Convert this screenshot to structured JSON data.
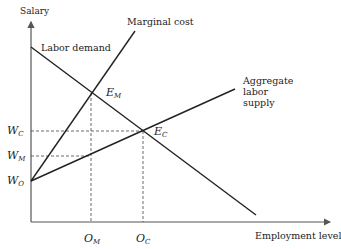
{
  "diagram": {
    "axes": {
      "y_label": "Salary",
      "x_label": "Employment level"
    },
    "curves": {
      "labor_demand": "Labor demand",
      "marginal_cost": "Marginal cost",
      "supply_line1": "Aggregate",
      "supply_line2": "labor",
      "supply_line3": "supply"
    },
    "points": {
      "em_main": "E",
      "em_sub": "M",
      "ec_main": "E",
      "ec_sub": "C"
    },
    "y_ticks": {
      "wc_main": "W",
      "wc_sub": "C",
      "wm_main": "W",
      "wm_sub": "M",
      "wo_main": "W",
      "wo_sub": "O"
    },
    "x_ticks": {
      "om_main": "O",
      "om_sub": "M",
      "oc_main": "O",
      "oc_sub": "C"
    },
    "colors": {
      "line": "#222222",
      "axis": "#555555",
      "dash": "#444444"
    }
  }
}
